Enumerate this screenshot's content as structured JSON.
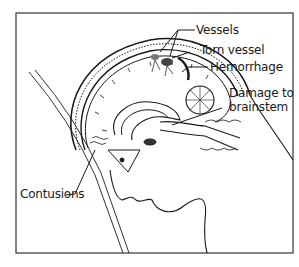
{
  "figure": {
    "labels": {
      "vessels": "Vessels",
      "torn_vessel": "Torn vessel",
      "hemorrhage": "Hemorrhage",
      "damage_line1": "Damage to",
      "damage_line2": "brainstem",
      "contusions": "Contusions"
    },
    "colors": {
      "ink": "#1a1a1a",
      "background": "#ffffff",
      "frame": "#333333"
    }
  }
}
